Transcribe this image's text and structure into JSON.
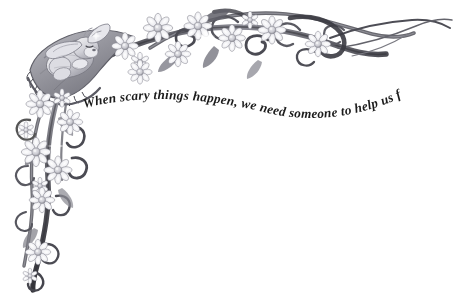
{
  "page": {
    "background_color": "#ffffff",
    "width": 460,
    "height": 294
  },
  "quote": {
    "text": "When scary things happen, we need someone to help us feel safe.",
    "style": "italic serif, arched baseline",
    "color": "#1c1c1c"
  },
  "illustration": {
    "name": "corner-border-ornament",
    "description": "Grayscale pencil-style decorative corner border running along the top edge and down the left edge",
    "palette": {
      "ink_dark": "#4a4a50",
      "ink_mid": "#8d8d95",
      "ink_light": "#bfbfc6",
      "highlight": "#f2f2f4",
      "shadow": "#2e2e34",
      "petal": "#fbfbfc",
      "petal_shade": "#c9c9d0",
      "flower_center": "#d7d7dc"
    },
    "elements": [
      {
        "name": "sleeping-bunny",
        "label": "Sleeping bunny"
      },
      {
        "name": "draped-blanket",
        "label": "Draped ruffled blanket"
      },
      {
        "name": "daisy-flowers",
        "label": "Daisy flowers"
      },
      {
        "name": "scrolling-vines",
        "label": "Scrolling vines and tendrils"
      },
      {
        "name": "sparkle-highlights",
        "label": "Sparkle highlights"
      }
    ]
  }
}
